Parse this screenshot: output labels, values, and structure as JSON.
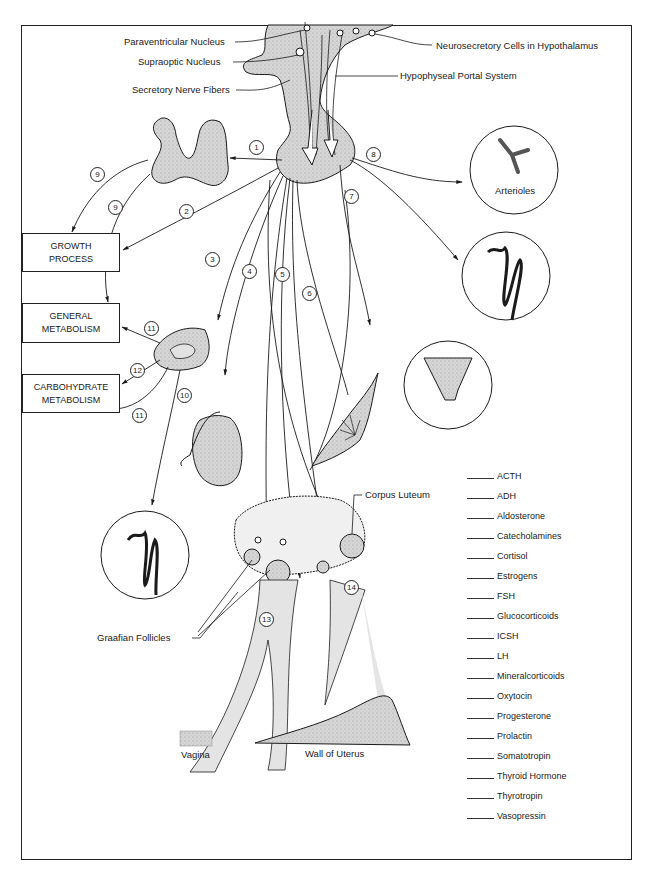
{
  "labels": {
    "paraventricular": "Paraventricular Nucleus",
    "supraoptic": "Supraoptic Nucleus",
    "secretory_fibers": "Secretory Nerve Fibers",
    "neurosecretory": "Neurosecretory Cells in Hypothalamus",
    "portal_system": "Hypophyseal Portal System",
    "arterioles": "Arterioles",
    "corpus_luteum": "Corpus Luteum",
    "graafian": "Graafian Follicles",
    "vagina": "Vagina",
    "uterus_wall": "Wall of Uterus"
  },
  "boxes": {
    "growth": [
      "GROWTH",
      "PROCESS"
    ],
    "general": [
      "GENERAL",
      "METABOLISM"
    ],
    "carbohydrate": [
      "CARBOHYDRATE",
      "METABOLISM"
    ]
  },
  "numbers": [
    "1",
    "2",
    "3",
    "4",
    "5",
    "6",
    "7",
    "8",
    "9",
    "9",
    "10",
    "11",
    "11",
    "12",
    "13",
    "14"
  ],
  "legend": [
    "ACTH",
    "ADH",
    "Aldosterone",
    "Catecholamines",
    "Cortisol",
    "Estrogens",
    "FSH",
    "Glucocorticoids",
    "ICSH",
    "LH",
    "Mineralcorticoids",
    "Oxytocin",
    "Progesterone",
    "Prolactin",
    "Somatotropin",
    "Thyroid Hormone",
    "Thyrotropin",
    "Vasopressin"
  ],
  "colors": {
    "line": "#1a1a1a",
    "tissue": "#d4d4d4",
    "tissue_dark": "#bdbdbd",
    "paper": "#ffffff"
  }
}
